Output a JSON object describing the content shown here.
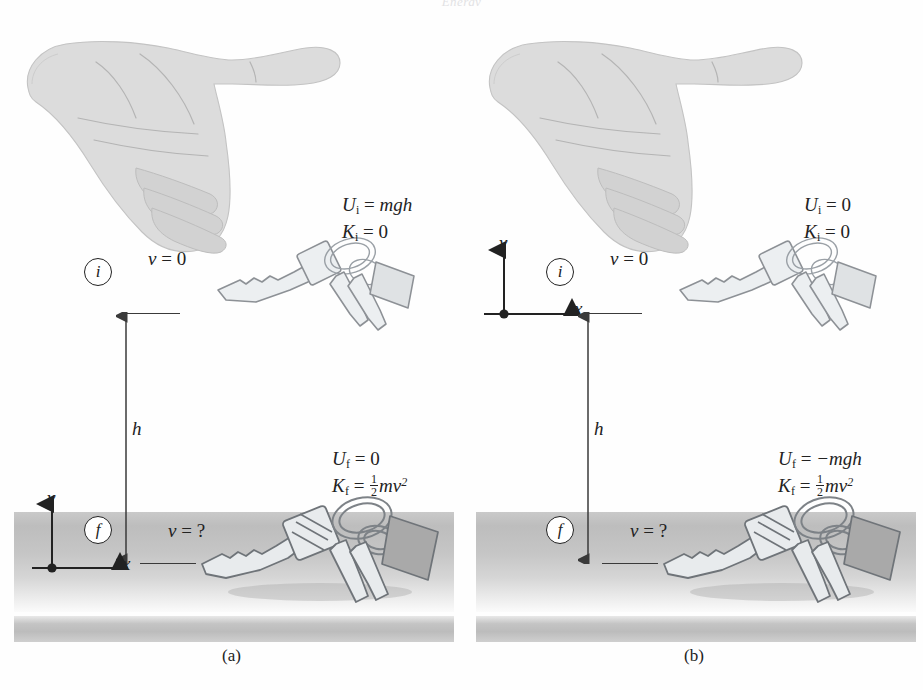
{
  "figure": {
    "running_head": "Energy",
    "background_color": "#ffffff",
    "ground_color": "#c4c4c4",
    "ink_color": "#222222",
    "illustration_color": "#d8d8d8"
  },
  "panels": [
    {
      "id": "a",
      "caption": "(a)",
      "origin_location": "ground",
      "initial": {
        "marker": "i",
        "velocity_label": "v = 0",
        "velocity_symbol": "v",
        "velocity_value": "0",
        "potential_energy": "U_i = mgh",
        "potential_symbol": "U",
        "potential_subscript": "i",
        "potential_value": "mgh",
        "kinetic_energy": "K_i = 0",
        "kinetic_symbol": "K",
        "kinetic_subscript": "i",
        "kinetic_value": "0"
      },
      "final": {
        "marker": "f",
        "velocity_label": "v = ?",
        "velocity_symbol": "v",
        "velocity_value": "?",
        "potential_symbol": "U",
        "potential_subscript": "f",
        "potential_value": "0",
        "kinetic_symbol": "K",
        "kinetic_subscript": "f",
        "kinetic_value": "½mv²"
      },
      "height_label": "h",
      "axes": {
        "y_label": "y",
        "x_label": "x",
        "position": "bottom"
      }
    },
    {
      "id": "b",
      "caption": "(b)",
      "origin_location": "initial-position",
      "initial": {
        "marker": "i",
        "velocity_label": "v = 0",
        "velocity_symbol": "v",
        "velocity_value": "0",
        "potential_energy": "U_i = 0",
        "potential_symbol": "U",
        "potential_subscript": "i",
        "potential_value": "0",
        "kinetic_energy": "K_i = 0",
        "kinetic_symbol": "K",
        "kinetic_subscript": "i",
        "kinetic_value": "0"
      },
      "final": {
        "marker": "f",
        "velocity_label": "v = ?",
        "velocity_symbol": "v",
        "velocity_value": "?",
        "potential_symbol": "U",
        "potential_subscript": "f",
        "potential_value": "−mgh",
        "kinetic_symbol": "K",
        "kinetic_subscript": "f",
        "kinetic_value": "½mv²"
      },
      "height_label": "h",
      "axes": {
        "y_label": "y",
        "x_label": "x",
        "position": "top"
      }
    }
  ],
  "symbols": {
    "equals": "=",
    "minus": "−",
    "one": "1",
    "two": "2",
    "m": "m",
    "v": "v",
    "g": "g",
    "h": "h",
    "squared": "2"
  }
}
